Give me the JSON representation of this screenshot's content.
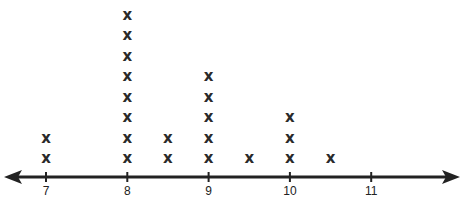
{
  "chart_data": {
    "type": "line_plot",
    "title": "",
    "xlabel": "",
    "ylabel": "",
    "x_ticks": [
      7,
      8,
      9,
      10,
      11
    ],
    "x_range": [
      6.5,
      11.9
    ],
    "marker": "X",
    "points": [
      {
        "x": 7,
        "count": 2
      },
      {
        "x": 8,
        "count": 8
      },
      {
        "x": 8.5,
        "count": 2
      },
      {
        "x": 9,
        "count": 5
      },
      {
        "x": 9.5,
        "count": 1
      },
      {
        "x": 10,
        "count": 3
      },
      {
        "x": 10.5,
        "count": 1
      }
    ],
    "grid": false,
    "legend": null
  },
  "axis": {
    "tick_labels": [
      "7",
      "8",
      "9",
      "10",
      "11"
    ],
    "line_color": "#222222"
  }
}
